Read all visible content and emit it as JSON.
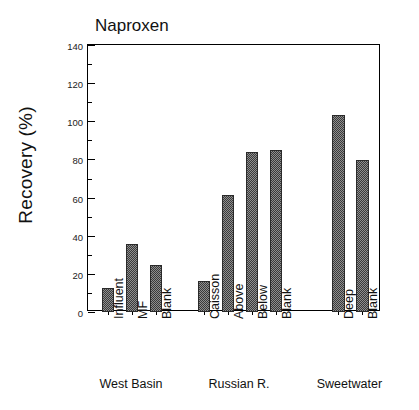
{
  "chart_data": {
    "type": "bar",
    "title": "Naproxen",
    "xlabel": "",
    "ylabel": "Recovery (%)",
    "ylim": [
      0,
      140
    ],
    "ytick_labels": [
      "0",
      "20",
      "40",
      "60",
      "80",
      "100",
      "120",
      "140"
    ],
    "ytick_values": [
      0,
      20,
      40,
      60,
      80,
      100,
      120,
      140
    ],
    "yminor_step": 10,
    "grid": false,
    "legend": null,
    "categories": [
      "Influent",
      "MF",
      "Blank",
      "Caisson",
      "Above",
      "Below",
      "Blank",
      "Deep",
      "Blank"
    ],
    "values": [
      12.5,
      35.5,
      24.5,
      16.5,
      61.5,
      84.0,
      85.0,
      103.5,
      79.5
    ],
    "groups": [
      {
        "label": "West Basin",
        "categories": [
          "Influent",
          "MF",
          "Blank"
        ],
        "values": [
          12.5,
          35.5,
          24.5
        ]
      },
      {
        "label": "Russian R.",
        "categories": [
          "Caisson",
          "Above",
          "Below",
          "Blank"
        ],
        "values": [
          16.5,
          61.5,
          84.0,
          85.0
        ]
      },
      {
        "label": "Sweetwater",
        "categories": [
          "Deep",
          "Blank"
        ],
        "values": [
          103.5,
          79.5
        ]
      }
    ],
    "bar_fill": "#8e8e8e",
    "bar_pattern": "checkerboard",
    "bar_edge_color": "#2a2a2a",
    "axis_color": "#000000"
  },
  "bar_slots": [
    {
      "name": "Influent",
      "value": 12.5,
      "slot": 0
    },
    {
      "name": "MF",
      "value": 35.5,
      "slot": 1
    },
    {
      "name": "Blank",
      "value": 24.5,
      "slot": 2
    },
    {
      "name": "Caisson",
      "value": 16.5,
      "slot": 4
    },
    {
      "name": "Above",
      "value": 61.5,
      "slot": 5
    },
    {
      "name": "Below",
      "value": 84.0,
      "slot": 6
    },
    {
      "name": "Blank",
      "value": 85.0,
      "slot": 7
    },
    {
      "name": "Deep",
      "value": 103.5,
      "slot": 9.6
    },
    {
      "name": "Blank",
      "value": 79.5,
      "slot": 10.6
    }
  ],
  "group_labels": [
    {
      "label": "West Basin",
      "center_slot": 1.0
    },
    {
      "label": "Russian R.",
      "center_slot": 5.5
    },
    {
      "label": "Sweetwater",
      "center_slot": 10.1
    }
  ]
}
